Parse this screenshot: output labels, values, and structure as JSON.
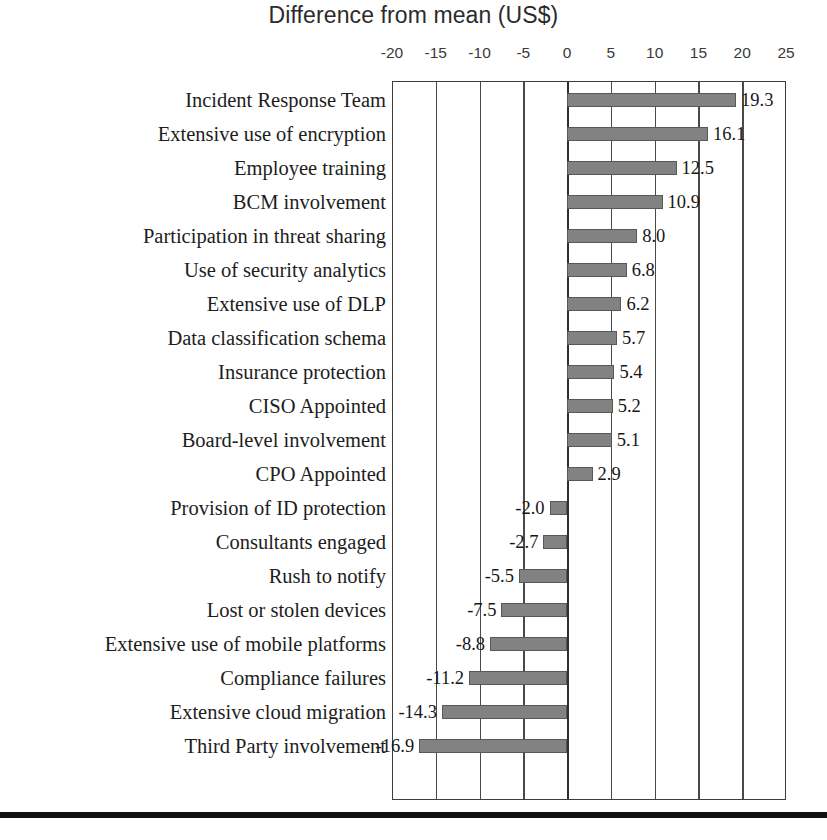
{
  "chart_data": {
    "type": "bar",
    "orientation": "horizontal",
    "title": "Difference from mean (US$)",
    "xlabel": "",
    "ylabel": "",
    "xlim": [
      -20,
      25
    ],
    "xticks": [
      -20,
      -15,
      -10,
      -5,
      0,
      5,
      10,
      15,
      20,
      25
    ],
    "xtick_labels": [
      "-20",
      "-15",
      "-10",
      "-5",
      "0",
      "5",
      "10",
      "15",
      "20",
      "25"
    ],
    "grid": true,
    "legend": false,
    "bar_color": "#828282",
    "bar_border_color": "#585858",
    "axis_color": "#3d3d3d",
    "categories": [
      "Incident Response Team",
      "Extensive use of encryption",
      "Employee training",
      "BCM involvement",
      "Participation in threat sharing",
      "Use of security analytics",
      "Extensive use of DLP",
      "Data classification schema",
      "Insurance protection",
      "CISO Appointed",
      "Board-level involvement",
      "CPO Appointed",
      "Provision of ID protection",
      "Consultants engaged",
      "Rush to notify",
      "Lost or stolen devices",
      "Extensive use of mobile platforms",
      "Compliance failures",
      "Extensive cloud migration",
      "Third Party involvement"
    ],
    "values": [
      19.3,
      16.1,
      12.5,
      10.9,
      8.0,
      6.8,
      6.2,
      5.7,
      5.4,
      5.2,
      5.1,
      2.9,
      -2.0,
      -2.7,
      -5.5,
      -7.5,
      -8.8,
      -11.2,
      -14.3,
      -16.9
    ],
    "value_labels": [
      "19.3",
      "16.1",
      "12.5",
      "10.9",
      "8.0",
      "6.8",
      "6.2",
      "5.7",
      "5.4",
      "5.2",
      "5.1",
      "2.9",
      "-2.0",
      "-2.7",
      "-5.5",
      "-7.5",
      "-8.8",
      "-11.2",
      "-14.3",
      "-16.9"
    ]
  }
}
